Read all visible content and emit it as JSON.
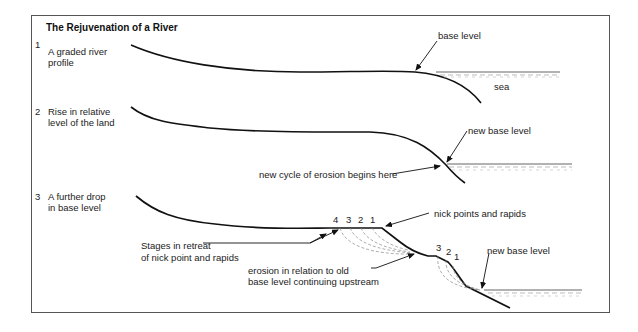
{
  "title": "The Rejuvenation of a River",
  "panels": [
    {
      "number": "1",
      "caption_line1": "A graded river",
      "caption_line2": "profile",
      "labels": {
        "base_level": "base level",
        "sea": "sea"
      }
    },
    {
      "number": "2",
      "caption_line1": "Rise in relative",
      "caption_line2": "level of the land",
      "labels": {
        "new_base_level": "new base level",
        "new_cycle": "new cycle of erosion begins here"
      }
    },
    {
      "number": "3",
      "caption_line1": "A further drop",
      "caption_line2": "in base level",
      "labels": {
        "nick_points": "nick points and rapids",
        "stages_line1": "Stages in retreat",
        "stages_line2": "of nick point and rapids",
        "erosion_line1": "erosion in relation to old",
        "erosion_line2": "base level continuing upstream",
        "new_base_level": "new base level"
      },
      "upper_stage_numbers": [
        "4",
        "3",
        "2",
        "1"
      ],
      "lower_stage_numbers": [
        "3",
        "2",
        "1"
      ]
    }
  ],
  "colors": {
    "line": "#111111",
    "frame": "#555555",
    "dashed": "#888888",
    "sea": "#999999"
  }
}
